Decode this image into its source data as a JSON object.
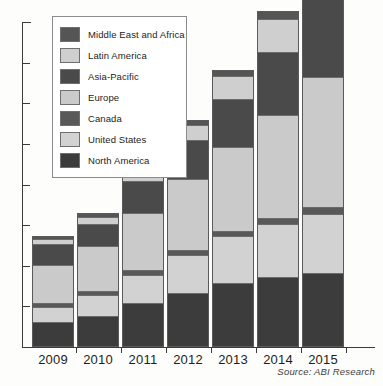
{
  "chart_data": {
    "type": "bar",
    "title": "",
    "subtitle": "",
    "xlabel": "",
    "ylabel": "",
    "stacked": true,
    "grid": false,
    "legend_position": "top-left",
    "axis": {
      "y_tick_count": 8,
      "y_labels_shown": false,
      "ylim": [
        0,
        8
      ]
    },
    "source_note": "Source: ABI Research",
    "categories": [
      "2009",
      "2010",
      "2011",
      "2012",
      "2013",
      "2014",
      "2015"
    ],
    "series": [
      {
        "name": "North America",
        "color": "#3c3c3c",
        "values": [
          0.6,
          0.75,
          1.05,
          1.3,
          1.55,
          1.7,
          1.8
        ]
      },
      {
        "name": "United States",
        "color": "#d2d2d2",
        "values": [
          0.35,
          0.5,
          0.7,
          0.95,
          1.15,
          1.3,
          1.45
        ]
      },
      {
        "name": "Canada",
        "color": "#595959",
        "values": [
          0.1,
          0.1,
          0.12,
          0.12,
          0.14,
          0.14,
          0.16
        ]
      },
      {
        "name": "Europe",
        "color": "#cacaca",
        "values": [
          0.95,
          1.1,
          1.4,
          1.75,
          2.05,
          2.55,
          3.2
        ]
      },
      {
        "name": "Asia-Pacific",
        "color": "#4a4a4a",
        "values": [
          0.5,
          0.55,
          0.8,
          0.95,
          1.2,
          1.55,
          1.95
        ]
      },
      {
        "name": "Latin America",
        "color": "#cfcfcf",
        "values": [
          0.14,
          0.18,
          0.2,
          0.38,
          0.55,
          0.8,
          1.05
        ]
      },
      {
        "name": "Middle East and Africa",
        "color": "#555555",
        "values": [
          0.04,
          0.06,
          0.08,
          0.1,
          0.14,
          0.18,
          0.32
        ]
      }
    ],
    "legend_order": [
      "Middle East and Africa",
      "Latin America",
      "Asia-Pacific",
      "Europe",
      "Canada",
      "United States",
      "North America"
    ]
  },
  "colors": {
    "axis": "#3a3a3a",
    "background": "#fdfdfc",
    "legend_border": "#8b8b8b",
    "bar_border": "#5a5a5a",
    "text": "#1d1d1b"
  }
}
